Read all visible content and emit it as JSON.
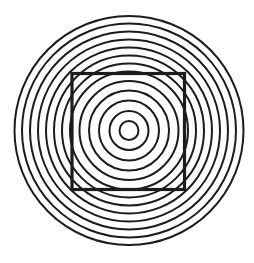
{
  "figure": {
    "width": 254,
    "height": 263,
    "background": "#ffffff",
    "stroke_color": "#1c1c1c",
    "circles": {
      "center": [
        129,
        130.5
      ],
      "radii": [
        9.5,
        19.5,
        30,
        40,
        49.5,
        59,
        67,
        75,
        83,
        91,
        99,
        107,
        114.5
      ],
      "stroke_width": 2
    },
    "square": {
      "x": 72,
      "y": 73.5,
      "width": 112.5,
      "height": 116,
      "stroke_width": 3.2
    }
  }
}
